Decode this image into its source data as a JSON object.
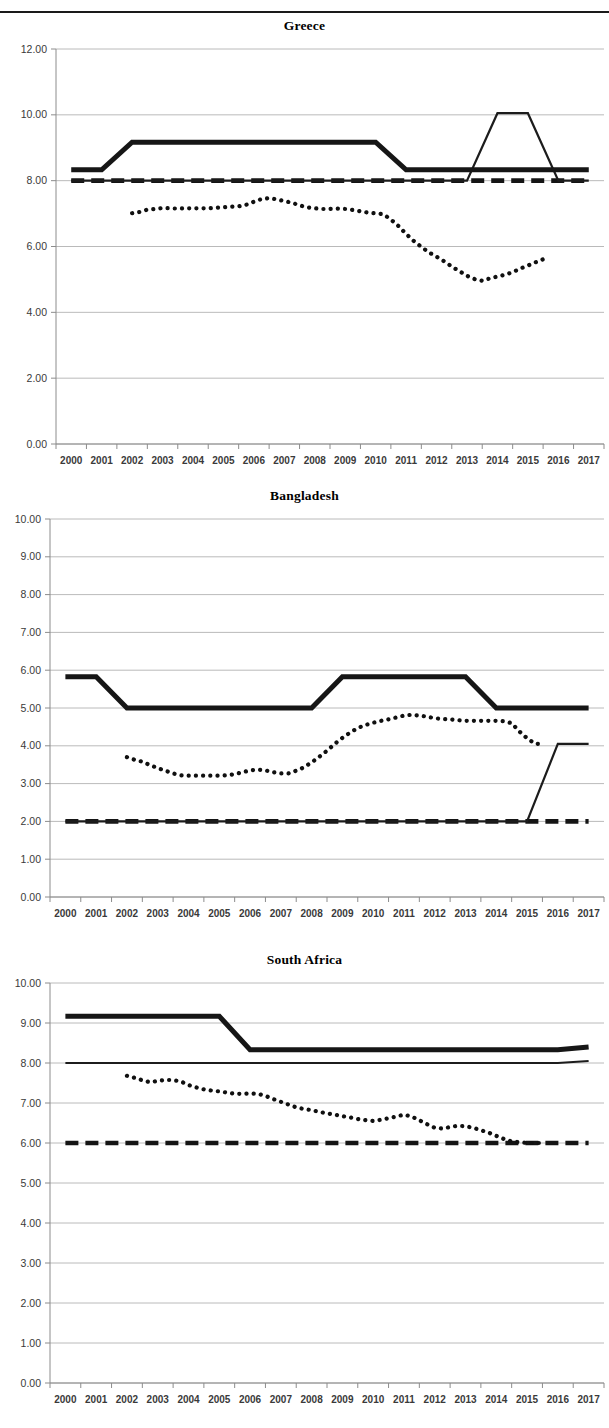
{
  "page": {
    "rule_color": "#1a1a1a",
    "background": "#ffffff"
  },
  "charts": [
    {
      "id": "greece",
      "title": "Greece"
    },
    {
      "id": "bangladesh",
      "title": "Bangladesh"
    },
    {
      "id": "southafrica",
      "title": "South Africa"
    }
  ],
  "chart_data": [
    {
      "type": "line",
      "title": "Greece",
      "xlabel": "",
      "ylabel": "",
      "grid": true,
      "legend_position": "none",
      "x": [
        2000,
        2001,
        2002,
        2003,
        2004,
        2005,
        2006,
        2007,
        2008,
        2009,
        2010,
        2011,
        2012,
        2013,
        2014,
        2015,
        2016,
        2017
      ],
      "xtick_labels": [
        "2000",
        "2001",
        "2002",
        "2003",
        "2004",
        "2005",
        "2006",
        "2007",
        "2008",
        "2009",
        "2010",
        "2011",
        "2012",
        "2013",
        "2014",
        "2015",
        "2016",
        "2017"
      ],
      "ylim": [
        0.0,
        12.0
      ],
      "ytick_labels": [
        "0.00",
        "2.00",
        "4.00",
        "6.00",
        "8.00",
        "10.00",
        "12.00"
      ],
      "yticks": [
        0.0,
        2.0,
        4.0,
        6.0,
        8.0,
        10.0,
        12.0
      ],
      "series": [
        {
          "name": "thick-solid",
          "style": "thick-solid",
          "values": [
            8.33,
            8.33,
            9.17,
            9.17,
            9.17,
            9.17,
            9.17,
            9.17,
            9.17,
            9.17,
            9.17,
            8.33,
            8.33,
            8.33,
            8.33,
            8.33,
            8.33,
            8.33
          ]
        },
        {
          "name": "thin-solid",
          "style": "thin-solid",
          "values": [
            8.0,
            8.0,
            8.0,
            8.0,
            8.0,
            8.0,
            8.0,
            8.0,
            8.0,
            8.0,
            8.0,
            8.0,
            8.0,
            8.0,
            10.05,
            10.05,
            8.0,
            8.0
          ]
        },
        {
          "name": "thick-dashed",
          "style": "thick-dashed",
          "values": [
            8.0,
            8.0,
            8.0,
            8.0,
            8.0,
            8.0,
            8.0,
            8.0,
            8.0,
            8.0,
            8.0,
            8.0,
            8.0,
            8.0,
            8.0,
            8.0,
            8.0,
            8.0
          ]
        },
        {
          "name": "dotted-index",
          "style": "dotted",
          "x_start": 2002.0,
          "x_step": 0.25,
          "values": [
            7.01,
            7.05,
            7.12,
            7.14,
            7.17,
            7.16,
            7.15,
            7.16,
            7.16,
            7.16,
            7.16,
            7.18,
            7.19,
            7.21,
            7.22,
            7.27,
            7.36,
            7.44,
            7.47,
            7.43,
            7.38,
            7.33,
            7.25,
            7.19,
            7.16,
            7.14,
            7.14,
            7.15,
            7.14,
            7.11,
            7.07,
            7.03,
            7.01,
            6.98,
            6.82,
            6.62,
            6.38,
            6.17,
            5.99,
            5.82,
            5.69,
            5.55,
            5.39,
            5.25,
            5.11,
            5.01,
            4.96,
            5.03,
            5.09,
            5.14,
            5.22,
            5.33,
            5.42,
            5.52,
            5.61
          ]
        }
      ]
    },
    {
      "type": "line",
      "title": "Bangladesh",
      "xlabel": "",
      "ylabel": "",
      "grid": true,
      "legend_position": "none",
      "x": [
        2000,
        2001,
        2002,
        2003,
        2004,
        2005,
        2006,
        2007,
        2008,
        2009,
        2010,
        2011,
        2012,
        2013,
        2014,
        2015,
        2016,
        2017
      ],
      "xtick_labels": [
        "2000",
        "2001",
        "2002",
        "2003",
        "2004",
        "2005",
        "2006",
        "2007",
        "2008",
        "2009",
        "2010",
        "2011",
        "2012",
        "2013",
        "2014",
        "2015",
        "2016",
        "2017"
      ],
      "ylim": [
        0.0,
        10.0
      ],
      "ytick_labels": [
        "0.00",
        "1.00",
        "2.00",
        "3.00",
        "4.00",
        "5.00",
        "6.00",
        "7.00",
        "8.00",
        "9.00",
        "10.00"
      ],
      "yticks": [
        0.0,
        1.0,
        2.0,
        3.0,
        4.0,
        5.0,
        6.0,
        7.0,
        8.0,
        9.0,
        10.0
      ],
      "series": [
        {
          "name": "thick-solid",
          "style": "thick-solid",
          "values": [
            5.83,
            5.83,
            5.0,
            5.0,
            5.0,
            5.0,
            5.0,
            5.0,
            5.0,
            5.83,
            5.83,
            5.83,
            5.83,
            5.83,
            5.0,
            5.0,
            5.0,
            5.0
          ]
        },
        {
          "name": "thin-solid",
          "style": "thin-solid",
          "values": [
            2.0,
            2.0,
            2.0,
            2.0,
            2.0,
            2.0,
            2.0,
            2.0,
            2.0,
            2.0,
            2.0,
            2.0,
            2.0,
            2.0,
            2.0,
            2.0,
            4.05,
            4.05
          ]
        },
        {
          "name": "thick-dashed",
          "style": "thick-dashed",
          "values": [
            2.0,
            2.0,
            2.0,
            2.0,
            2.0,
            2.0,
            2.0,
            2.0,
            2.0,
            2.0,
            2.0,
            2.0,
            2.0,
            2.0,
            2.0,
            2.0,
            2.0,
            2.0
          ]
        },
        {
          "name": "dotted-index",
          "style": "dotted",
          "x_start": 2002.0,
          "x_step": 0.25,
          "values": [
            3.7,
            3.63,
            3.58,
            3.49,
            3.41,
            3.34,
            3.27,
            3.22,
            3.21,
            3.21,
            3.21,
            3.21,
            3.21,
            3.22,
            3.25,
            3.3,
            3.35,
            3.37,
            3.35,
            3.3,
            3.27,
            3.27,
            3.34,
            3.43,
            3.56,
            3.71,
            3.87,
            4.05,
            4.21,
            4.35,
            4.47,
            4.55,
            4.61,
            4.66,
            4.7,
            4.75,
            4.8,
            4.82,
            4.8,
            4.77,
            4.73,
            4.71,
            4.7,
            4.68,
            4.66,
            4.66,
            4.66,
            4.66,
            4.66,
            4.65,
            4.6,
            4.38,
            4.2,
            4.06,
            4.04
          ]
        }
      ]
    },
    {
      "type": "line",
      "title": "South Africa",
      "xlabel": "",
      "ylabel": "",
      "grid": true,
      "legend_position": "none",
      "x": [
        2000,
        2001,
        2002,
        2003,
        2004,
        2005,
        2006,
        2007,
        2008,
        2009,
        2010,
        2011,
        2012,
        2013,
        2014,
        2015,
        2016,
        2017
      ],
      "xtick_labels": [
        "2000",
        "2001",
        "2002",
        "2003",
        "2004",
        "2005",
        "2006",
        "2007",
        "2008",
        "2009",
        "2010",
        "2011",
        "2012",
        "2013",
        "2014",
        "2015",
        "2016",
        "2017"
      ],
      "ylim": [
        0.0,
        10.0
      ],
      "ytick_labels": [
        "0.00",
        "1.00",
        "2.00",
        "3.00",
        "4.00",
        "5.00",
        "6.00",
        "7.00",
        "8.00",
        "9.00",
        "10.00"
      ],
      "yticks": [
        0.0,
        1.0,
        2.0,
        3.0,
        4.0,
        5.0,
        6.0,
        7.0,
        8.0,
        9.0,
        10.0
      ],
      "series": [
        {
          "name": "thick-solid",
          "style": "thick-solid",
          "values": [
            9.17,
            9.17,
            9.17,
            9.17,
            9.17,
            9.17,
            8.33,
            8.33,
            8.33,
            8.33,
            8.33,
            8.33,
            8.33,
            8.33,
            8.33,
            8.33,
            8.33,
            8.4
          ]
        },
        {
          "name": "thin-solid",
          "style": "thin-solid",
          "values": [
            8.0,
            8.0,
            8.0,
            8.0,
            8.0,
            8.0,
            8.0,
            8.0,
            8.0,
            8.0,
            8.0,
            8.0,
            8.0,
            8.0,
            8.0,
            8.0,
            8.0,
            8.05
          ]
        },
        {
          "name": "thick-dashed",
          "style": "thick-dashed",
          "values": [
            6.0,
            6.0,
            6.0,
            6.0,
            6.0,
            6.0,
            6.0,
            6.0,
            6.0,
            6.0,
            6.0,
            6.0,
            6.0,
            6.0,
            6.0,
            6.0,
            6.0,
            6.0
          ]
        },
        {
          "name": "dotted-index",
          "style": "dotted",
          "x_start": 2002.0,
          "x_step": 0.25,
          "values": [
            7.68,
            7.63,
            7.57,
            7.52,
            7.55,
            7.58,
            7.57,
            7.54,
            7.45,
            7.39,
            7.34,
            7.31,
            7.29,
            7.26,
            7.23,
            7.23,
            7.24,
            7.23,
            7.18,
            7.1,
            7.03,
            6.96,
            6.89,
            6.85,
            6.82,
            6.78,
            6.74,
            6.71,
            6.67,
            6.64,
            6.6,
            6.57,
            6.55,
            6.58,
            6.62,
            6.66,
            6.71,
            6.66,
            6.57,
            6.47,
            6.38,
            6.36,
            6.4,
            6.43,
            6.42,
            6.38,
            6.32,
            6.26,
            6.18,
            6.1,
            6.04,
            6.02,
            6.0,
            6.0,
            6.0
          ]
        }
      ]
    }
  ]
}
